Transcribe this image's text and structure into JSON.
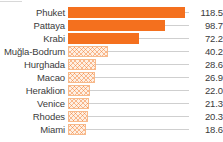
{
  "chart_data": {
    "type": "bar",
    "orientation": "horizontal",
    "title": "",
    "subtitle": "",
    "xlabel": "",
    "ylabel": "",
    "grid": false,
    "legend": null,
    "xlim": [
      0,
      118.5
    ],
    "categories": [
      "Phuket",
      "Pattaya",
      "Krabi",
      "Muğla-Bodrum",
      "Hurghada",
      "Macao",
      "Heraklion",
      "Venice",
      "Rhodes",
      "Miami"
    ],
    "values": [
      118.5,
      98.7,
      72.2,
      40.2,
      28.6,
      26.9,
      22.0,
      21.3,
      20.3,
      18.6
    ],
    "value_labels": [
      "118.5",
      "98.7",
      "72.2",
      "40.2",
      "28.6",
      "26.9",
      "22.0",
      "21.3",
      "20.3",
      "18.6"
    ],
    "styles": [
      "solid",
      "solid",
      "solid",
      "hatched",
      "hatched",
      "hatched",
      "hatched",
      "hatched",
      "hatched",
      "hatched"
    ]
  },
  "colors": {
    "bar_solid": "#f4701e",
    "bar_hatch_fill": "#fdf0e4",
    "bar_hatch_stroke": "#f7b98a",
    "leader_line": "#cfcfcf",
    "text": "#3b3b3b",
    "background": "#ffffff"
  },
  "rows": [
    {
      "category": "Phuket",
      "value_label": "118.5",
      "value": 118.5,
      "style": "solid"
    },
    {
      "category": "Pattaya",
      "value_label": "98.7",
      "value": 98.7,
      "style": "solid"
    },
    {
      "category": "Krabi",
      "value_label": "72.2",
      "value": 72.2,
      "style": "solid"
    },
    {
      "category": "Muğla-Bodrum",
      "value_label": "40.2",
      "value": 40.2,
      "style": "hatched"
    },
    {
      "category": "Hurghada",
      "value_label": "28.6",
      "value": 28.6,
      "style": "hatched"
    },
    {
      "category": "Macao",
      "value_label": "26.9",
      "value": 26.9,
      "style": "hatched"
    },
    {
      "category": "Heraklion",
      "value_label": "22.0",
      "value": 22.0,
      "style": "hatched"
    },
    {
      "category": "Venice",
      "value_label": "21.3",
      "value": 21.3,
      "style": "hatched"
    },
    {
      "category": "Rhodes",
      "value_label": "20.3",
      "value": 20.3,
      "style": "hatched"
    },
    {
      "category": "Miami",
      "value_label": "18.6",
      "value": 18.6,
      "style": "hatched"
    }
  ]
}
